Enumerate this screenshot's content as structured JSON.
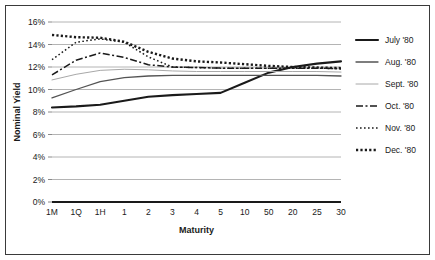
{
  "chart_data": {
    "type": "line",
    "title": "",
    "xlabel": "Maturity",
    "ylabel": "Nominal Yield",
    "categories": [
      "1M",
      "1Q",
      "1H",
      "1",
      "2",
      "3",
      "4",
      "5",
      "10",
      "50",
      "20",
      "25",
      "30"
    ],
    "ylim": [
      0,
      16
    ],
    "ytick_values": [
      0,
      2,
      4,
      6,
      8,
      10,
      12,
      14,
      16
    ],
    "ytick_labels": [
      "0%",
      "2%",
      "4%",
      "6%",
      "8%",
      "10%",
      "12%",
      "14%",
      "16%"
    ],
    "grid": "horizontal",
    "legend_position": "right",
    "series": [
      {
        "name": "July '80",
        "style": "solid",
        "color": "#1a1a1a",
        "width": 2.1,
        "dash": "",
        "values": [
          8.4,
          8.5,
          8.65,
          9.0,
          9.35,
          9.5,
          9.6,
          9.7,
          10.6,
          11.5,
          12.0,
          12.3,
          12.5
        ]
      },
      {
        "name": "Aug. '80",
        "style": "solid",
        "color": "#545454",
        "width": 1.3,
        "dash": "",
        "values": [
          9.25,
          10.0,
          10.7,
          11.05,
          11.2,
          11.25,
          11.25,
          11.25,
          11.25,
          11.25,
          11.25,
          11.25,
          11.2
        ]
      },
      {
        "name": "Sept. '80",
        "style": "solid",
        "color": "#a8a8a8",
        "width": 1.0,
        "dash": "",
        "values": [
          10.85,
          11.35,
          11.7,
          11.8,
          11.75,
          11.65,
          11.6,
          11.6,
          11.6,
          11.6,
          11.6,
          11.6,
          11.55
        ]
      },
      {
        "name": "Oct. '80",
        "style": "dash-dot",
        "color": "#1a1a1a",
        "width": 1.5,
        "dash": "7,2.5,2,2.5",
        "values": [
          11.3,
          12.6,
          13.25,
          12.85,
          12.2,
          12.0,
          11.95,
          11.9,
          11.9,
          11.9,
          11.9,
          11.9,
          11.85
        ]
      },
      {
        "name": "Nov. '80",
        "style": "dotted-fine",
        "color": "#1a1a1a",
        "width": 1.5,
        "dash": "1.6,2.4",
        "values": [
          12.65,
          14.2,
          14.5,
          14.2,
          12.9,
          12.0,
          11.95,
          11.9,
          11.9,
          11.9,
          11.9,
          11.9,
          11.85
        ]
      },
      {
        "name": "Dec. '80",
        "style": "dotted-heavy",
        "color": "#1a1a1a",
        "width": 2.4,
        "dash": "2.2,2.2",
        "values": [
          14.85,
          14.65,
          14.6,
          14.25,
          13.35,
          12.75,
          12.5,
          12.4,
          12.25,
          12.1,
          12.0,
          11.95,
          11.9
        ]
      }
    ]
  }
}
